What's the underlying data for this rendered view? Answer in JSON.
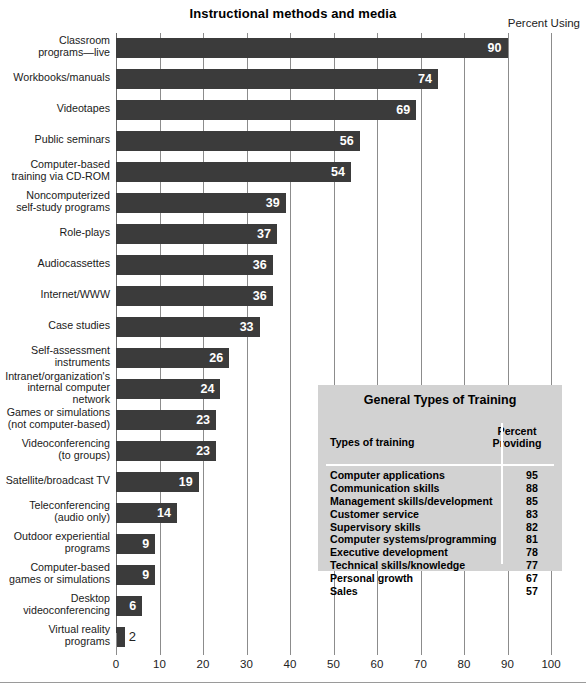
{
  "chart_data": {
    "type": "bar",
    "orientation": "horizontal",
    "title": "Instructional methods and media",
    "value_axis_caption": "Percent Using",
    "xlabel": "",
    "ylabel": "",
    "xlim": [
      0,
      100
    ],
    "xticks": [
      0,
      10,
      20,
      30,
      40,
      50,
      60,
      70,
      80,
      90,
      100
    ],
    "grid": true,
    "legend": "none",
    "bar_color": "#3b3b3b",
    "categories": [
      "Classroom\nprograms—live",
      "Workbooks/manuals",
      "Videotapes",
      "Public seminars",
      "Computer-based\ntraining via CD-ROM",
      "Noncomputerized\nself-study programs",
      "Role-plays",
      "Audiocassettes",
      "Internet/WWW",
      "Case studies",
      "Self-assessment\ninstruments",
      "Intranet/organization's\ninternal computer\nnetwork",
      "Games or simulations\n(not computer-based)",
      "Videoconferencing\n(to groups)",
      "Satellite/broadcast TV",
      "Teleconferencing\n(audio only)",
      "Outdoor experiential\nprograms",
      "Computer-based\ngames or simulations",
      "Desktop\nvideoconferencing",
      "Virtual reality\nprograms"
    ],
    "values": [
      90,
      74,
      69,
      56,
      54,
      39,
      37,
      36,
      36,
      33,
      26,
      24,
      23,
      23,
      19,
      14,
      9,
      9,
      6,
      2
    ]
  },
  "chart": {
    "title": "Instructional methods and media",
    "percent_using_caption": "Percent Using",
    "tick_labels": [
      "0",
      "10",
      "20",
      "30",
      "40",
      "50",
      "60",
      "70",
      "80",
      "90",
      "100"
    ],
    "rows": [
      {
        "label": "Classroom\nprograms—live",
        "value": "90",
        "lines": [
          "Classroom",
          "programs—live"
        ]
      },
      {
        "label": "Workbooks/manuals",
        "value": "74",
        "lines": [
          "Workbooks/manuals"
        ]
      },
      {
        "label": "Videotapes",
        "value": "69",
        "lines": [
          "Videotapes"
        ]
      },
      {
        "label": "Public seminars",
        "value": "56",
        "lines": [
          "Public seminars"
        ]
      },
      {
        "label": "Computer-based training via CD-ROM",
        "value": "54",
        "lines": [
          "Computer-based",
          "training via CD-ROM"
        ]
      },
      {
        "label": "Noncomputerized self-study programs",
        "value": "39",
        "lines": [
          "Noncomputerized",
          "self-study programs"
        ]
      },
      {
        "label": "Role-plays",
        "value": "37",
        "lines": [
          "Role-plays"
        ]
      },
      {
        "label": "Audiocassettes",
        "value": "36",
        "lines": [
          "Audiocassettes"
        ]
      },
      {
        "label": "Internet/WWW",
        "value": "36",
        "lines": [
          "Internet/WWW"
        ]
      },
      {
        "label": "Case studies",
        "value": "33",
        "lines": [
          "Case studies"
        ]
      },
      {
        "label": "Self-assessment instruments",
        "value": "26",
        "lines": [
          "Self-assessment",
          "instruments"
        ]
      },
      {
        "label": "Intranet/organization's internal computer network",
        "value": "24",
        "lines": [
          "Intranet/organization's",
          "internal computer",
          "network"
        ]
      },
      {
        "label": "Games or simulations (not computer-based)",
        "value": "23",
        "lines": [
          "Games or simulations",
          "(not computer-based)"
        ]
      },
      {
        "label": "Videoconferencing (to groups)",
        "value": "23",
        "lines": [
          "Videoconferencing",
          "(to groups)"
        ]
      },
      {
        "label": "Satellite/broadcast TV",
        "value": "19",
        "lines": [
          "Satellite/broadcast TV"
        ]
      },
      {
        "label": "Teleconferencing (audio only)",
        "value": "14",
        "lines": [
          "Teleconferencing",
          "(audio only)"
        ]
      },
      {
        "label": "Outdoor experiential programs",
        "value": "9",
        "lines": [
          "Outdoor experiential",
          "programs"
        ]
      },
      {
        "label": "Computer-based games or simulations",
        "value": "9",
        "lines": [
          "Computer-based",
          "games or simulations"
        ]
      },
      {
        "label": "Desktop videoconferencing",
        "value": "6",
        "lines": [
          "Desktop",
          "videoconferencing"
        ]
      },
      {
        "label": "Virtual reality programs",
        "value": "2",
        "lines": [
          "Virtual reality",
          "programs"
        ]
      }
    ]
  },
  "inset_table": {
    "title": "General Types of Training",
    "col_types_header": "Types of training",
    "col_percent_header_line1": "Percent",
    "col_percent_header_line2": "Providing",
    "rows": [
      {
        "type": "Computer applications",
        "percent": "95"
      },
      {
        "type": "Communication skills",
        "percent": "88"
      },
      {
        "type": "Management skills/development",
        "percent": "85"
      },
      {
        "type": "Customer service",
        "percent": "83"
      },
      {
        "type": "Supervisory skills",
        "percent": "82"
      },
      {
        "type": "Computer systems/programming",
        "percent": "81"
      },
      {
        "type": "Executive development",
        "percent": "78"
      },
      {
        "type": "Technical skills/knowledge",
        "percent": "77"
      },
      {
        "type": "Personal growth",
        "percent": "67"
      },
      {
        "type": "Sales",
        "percent": "57"
      }
    ]
  }
}
